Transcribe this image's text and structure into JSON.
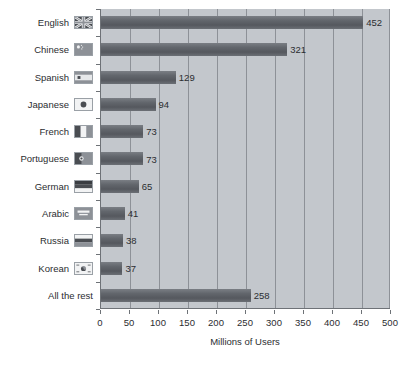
{
  "chart_data": {
    "type": "bar",
    "orientation": "horizontal",
    "title": "",
    "xlabel": "Millions of Users",
    "ylabel": "",
    "xlim": [
      0,
      500
    ],
    "xticks": [
      0,
      50,
      100,
      150,
      200,
      250,
      300,
      350,
      400,
      450,
      500
    ],
    "grid": true,
    "legend": "none",
    "categories": [
      "English",
      "Chinese",
      "Spanish",
      "Japanese",
      "French",
      "Portuguese",
      "German",
      "Arabic",
      "Russia",
      "Korean",
      "All the rest"
    ],
    "values": [
      452,
      321,
      129,
      94,
      73,
      73,
      65,
      41,
      38,
      37,
      258
    ],
    "value_labels": [
      "452",
      "321",
      "129",
      "94",
      "73",
      "73",
      "65",
      "41",
      "38",
      "37",
      "258"
    ],
    "flags": [
      "flag-united-kingdom-icon",
      "flag-china-icon",
      "flag-spain-icon",
      "flag-japan-icon",
      "flag-france-icon",
      "flag-portugal-icon",
      "flag-germany-icon",
      "flag-arabic-icon",
      "flag-russia-icon",
      "flag-south-korea-icon",
      "none"
    ]
  },
  "style": {
    "plot_background": "#c3c7cc",
    "bar_color": "#62666c",
    "grid_color": "#8d9197",
    "axis_color": "#6e7277",
    "text_color": "#2b2d30",
    "page_background": "#ffffff"
  }
}
